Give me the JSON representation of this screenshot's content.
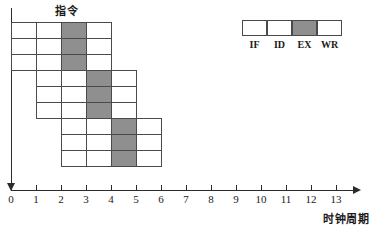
{
  "figure": {
    "title_y_axis": "指令",
    "title_x_axis": "时钟周期",
    "colors": {
      "axis": "#2b2b2b",
      "cell_border": "#4a4a4a",
      "cell_fill": "#ffffff",
      "cell_shaded_fill": "#8f8f8f",
      "background": "#ffffff"
    }
  },
  "x_axis": {
    "min": 0,
    "max": 13,
    "tick_spacing_px": 25,
    "origin_px": 11,
    "ticks": [
      "0",
      "1",
      "2",
      "3",
      "4",
      "5",
      "6",
      "7",
      "8",
      "9",
      "10",
      "11",
      "12",
      "13"
    ]
  },
  "legend": {
    "stages": [
      {
        "label": "IF",
        "shaded": false
      },
      {
        "label": "ID",
        "shaded": false
      },
      {
        "label": "EX",
        "shaded": true
      },
      {
        "label": "WR",
        "shaded": false
      }
    ]
  },
  "chart_data": {
    "type": "table",
    "xlabel": "时钟周期",
    "ylabel": "指令",
    "xlim": [
      0,
      13
    ],
    "grid": false,
    "legend_position": "top-right",
    "stage_names": [
      "IF",
      "ID",
      "EX",
      "WR"
    ],
    "shaded_stage": "EX",
    "row_height_px": 16,
    "first_row_top_px": 22,
    "instructions": [
      {
        "row": 1,
        "start_cycle": 0,
        "stages": [
          {
            "name": "IF",
            "start": 0,
            "end": 1,
            "shaded": false
          },
          {
            "name": "ID",
            "start": 1,
            "end": 2,
            "shaded": false
          },
          {
            "name": "EX",
            "start": 2,
            "end": 3,
            "shaded": true
          },
          {
            "name": "WR",
            "start": 3,
            "end": 4,
            "shaded": false
          }
        ]
      },
      {
        "row": 2,
        "start_cycle": 0,
        "stages": [
          {
            "name": "IF",
            "start": 0,
            "end": 1,
            "shaded": false
          },
          {
            "name": "ID",
            "start": 1,
            "end": 2,
            "shaded": false
          },
          {
            "name": "EX",
            "start": 2,
            "end": 3,
            "shaded": true
          },
          {
            "name": "WR",
            "start": 3,
            "end": 4,
            "shaded": false
          }
        ]
      },
      {
        "row": 3,
        "start_cycle": 0,
        "stages": [
          {
            "name": "IF",
            "start": 0,
            "end": 1,
            "shaded": false
          },
          {
            "name": "ID",
            "start": 1,
            "end": 2,
            "shaded": false
          },
          {
            "name": "EX",
            "start": 2,
            "end": 3,
            "shaded": true
          },
          {
            "name": "WR",
            "start": 3,
            "end": 4,
            "shaded": false
          }
        ]
      },
      {
        "row": 4,
        "start_cycle": 1,
        "stages": [
          {
            "name": "IF",
            "start": 1,
            "end": 2,
            "shaded": false
          },
          {
            "name": "ID",
            "start": 2,
            "end": 3,
            "shaded": false
          },
          {
            "name": "EX",
            "start": 3,
            "end": 4,
            "shaded": true
          },
          {
            "name": "WR",
            "start": 4,
            "end": 5,
            "shaded": false
          }
        ]
      },
      {
        "row": 5,
        "start_cycle": 1,
        "stages": [
          {
            "name": "IF",
            "start": 1,
            "end": 2,
            "shaded": false
          },
          {
            "name": "ID",
            "start": 2,
            "end": 3,
            "shaded": false
          },
          {
            "name": "EX",
            "start": 3,
            "end": 4,
            "shaded": true
          },
          {
            "name": "WR",
            "start": 4,
            "end": 5,
            "shaded": false
          }
        ]
      },
      {
        "row": 6,
        "start_cycle": 1,
        "stages": [
          {
            "name": "IF",
            "start": 1,
            "end": 2,
            "shaded": false
          },
          {
            "name": "ID",
            "start": 2,
            "end": 3,
            "shaded": false
          },
          {
            "name": "EX",
            "start": 3,
            "end": 4,
            "shaded": true
          },
          {
            "name": "WR",
            "start": 4,
            "end": 5,
            "shaded": false
          }
        ]
      },
      {
        "row": 7,
        "start_cycle": 2,
        "stages": [
          {
            "name": "IF",
            "start": 2,
            "end": 3,
            "shaded": false
          },
          {
            "name": "ID",
            "start": 3,
            "end": 4,
            "shaded": false
          },
          {
            "name": "EX",
            "start": 4,
            "end": 5,
            "shaded": true
          },
          {
            "name": "WR",
            "start": 5,
            "end": 6,
            "shaded": false
          }
        ]
      },
      {
        "row": 8,
        "start_cycle": 2,
        "stages": [
          {
            "name": "IF",
            "start": 2,
            "end": 3,
            "shaded": false
          },
          {
            "name": "ID",
            "start": 3,
            "end": 4,
            "shaded": false
          },
          {
            "name": "EX",
            "start": 4,
            "end": 5,
            "shaded": true
          },
          {
            "name": "WR",
            "start": 5,
            "end": 6,
            "shaded": false
          }
        ]
      },
      {
        "row": 9,
        "start_cycle": 2,
        "stages": [
          {
            "name": "IF",
            "start": 2,
            "end": 3,
            "shaded": false
          },
          {
            "name": "ID",
            "start": 3,
            "end": 4,
            "shaded": false
          },
          {
            "name": "EX",
            "start": 4,
            "end": 5,
            "shaded": true
          },
          {
            "name": "WR",
            "start": 5,
            "end": 6,
            "shaded": false
          }
        ]
      }
    ]
  }
}
